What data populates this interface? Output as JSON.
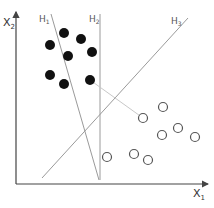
{
  "diagram": {
    "title": "",
    "axes": {
      "x_label": "X",
      "x_label_sub": "1",
      "y_label": "X",
      "y_label_sub": "2"
    },
    "hyperplanes": [
      {
        "id": "H1",
        "label": "H",
        "sub": "1",
        "from": [
          51,
          14
        ],
        "to": [
          99,
          180
        ]
      },
      {
        "id": "H2",
        "label": "H",
        "sub": "2",
        "from": [
          100,
          14
        ],
        "to": [
          100,
          180
        ]
      },
      {
        "id": "H3",
        "label": "H",
        "sub": "3",
        "from": [
          42,
          178
        ],
        "to": [
          188,
          18
        ]
      }
    ],
    "class_filled": [
      [
        64,
        33
      ],
      [
        81,
        39
      ],
      [
        50,
        45
      ],
      [
        68,
        56
      ],
      [
        92,
        52
      ],
      [
        50,
        75
      ],
      [
        64,
        84
      ],
      [
        90,
        80
      ]
    ],
    "class_open": [
      [
        163,
        107
      ],
      [
        143,
        118
      ],
      [
        162,
        135
      ],
      [
        178,
        128
      ],
      [
        195,
        137
      ],
      [
        107,
        157
      ],
      [
        134,
        154
      ],
      [
        148,
        160
      ]
    ],
    "margin_line": {
      "from": [
        90,
        80
      ],
      "to": [
        143,
        118
      ]
    },
    "colors": {
      "filled": "#111111",
      "open_stroke": "#555555",
      "hyperplane": "#9a9a9a",
      "axis": "#444444"
    }
  }
}
